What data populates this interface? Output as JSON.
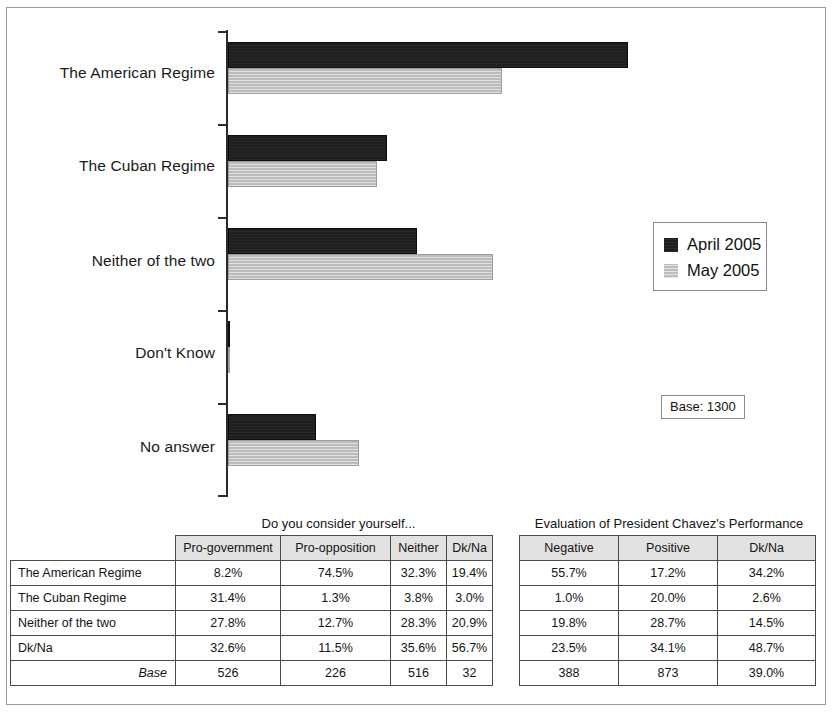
{
  "chart_data": {
    "type": "bar",
    "orientation": "horizontal",
    "title": "",
    "xlabel": "",
    "ylabel": "",
    "grid": false,
    "legend_position": "right",
    "categories": [
      "The American Regime",
      "The Cuban Regime",
      "Neither of the two",
      "Don't Know",
      "No answer"
    ],
    "series": [
      {
        "name": "April 2005",
        "color": "#1e1e1e",
        "values": [
          40.0,
          15.9,
          18.9,
          18.6,
          8.8
        ]
      },
      {
        "name": "May 2005",
        "color": "#c3c3c3",
        "values": [
          27.4,
          14.9,
          26.5,
          20.6,
          13.1
        ]
      }
    ],
    "xlim": [
      0,
      42
    ],
    "base_note": "Base: 1300"
  },
  "legend": {
    "entries": [
      {
        "label": "April 2005",
        "swatch": "dark-swatch"
      },
      {
        "label": "May 2005",
        "swatch": "light-swatch"
      }
    ]
  },
  "base_box": {
    "text": "Base: 1300"
  },
  "left_table": {
    "caption": "Do you consider yourself...",
    "columns": [
      "Pro-government",
      "Pro-opposition",
      "Neither",
      "Dk/Na"
    ],
    "rows": [
      {
        "label": "The American Regime",
        "values": [
          "8.2%",
          "74.5%",
          "32.3%",
          "19.4%"
        ]
      },
      {
        "label": "The Cuban Regime",
        "values": [
          "31.4%",
          "1.3%",
          "3.8%",
          "3.0%"
        ]
      },
      {
        "label": "Neither of the two",
        "values": [
          "27.8%",
          "12.7%",
          "28.3%",
          "20.9%"
        ]
      },
      {
        "label": "Dk/Na",
        "values": [
          "32.6%",
          "11.5%",
          "35.6%",
          "56.7%"
        ]
      }
    ],
    "base_label": "Base",
    "base_values": [
      "526",
      "226",
      "516",
      "32"
    ]
  },
  "right_table": {
    "caption": "Evaluation of President Chavez's Performance",
    "columns": [
      "Negative",
      "Positive",
      "Dk/Na"
    ],
    "rows": [
      {
        "values": [
          "55.7%",
          "17.2%",
          "34.2%"
        ]
      },
      {
        "values": [
          "1.0%",
          "20.0%",
          "2.6%"
        ]
      },
      {
        "values": [
          "19.8%",
          "28.7%",
          "14.5%"
        ]
      },
      {
        "values": [
          "23.5%",
          "34.1%",
          "48.7%"
        ]
      }
    ],
    "base_values": [
      "388",
      "873",
      "39.0%"
    ]
  }
}
